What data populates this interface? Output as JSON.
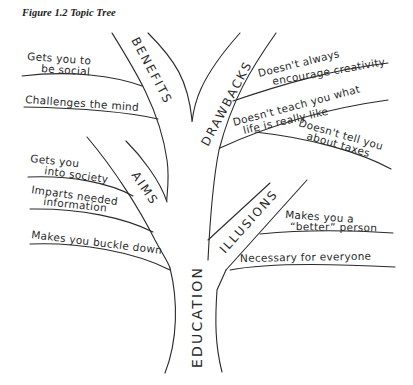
{
  "figure": {
    "title": "Figure 1.2  Topic Tree"
  },
  "trunk": {
    "label": "EDUCATION"
  },
  "branches": [
    {
      "label": "BENEFITS",
      "leaves": [
        {
          "lines": [
            "Gets you to",
            "be social"
          ]
        },
        {
          "lines": [
            "Challenges the mind"
          ]
        }
      ]
    },
    {
      "label": "DRAWBACKS",
      "leaves": [
        {
          "lines": [
            "Doesn't always",
            "encourage creativity"
          ]
        },
        {
          "lines": [
            "Doesn't teach you what",
            "life is really like"
          ]
        },
        {
          "lines": [
            "Doesn't tell you",
            "about taxes"
          ]
        }
      ]
    },
    {
      "label": "AIMS",
      "leaves": [
        {
          "lines": [
            "Gets you",
            "into society"
          ]
        },
        {
          "lines": [
            "Imparts needed",
            "information"
          ]
        },
        {
          "lines": [
            "Makes you buckle down"
          ]
        }
      ]
    },
    {
      "label": "ILLUSIONS",
      "leaves": [
        {
          "lines": [
            "Makes you a",
            "“better” person"
          ]
        },
        {
          "lines": [
            "Necessary for everyone"
          ]
        }
      ]
    }
  ],
  "colors": {
    "ink": "#2a2a2a",
    "background": "#ffffff"
  }
}
